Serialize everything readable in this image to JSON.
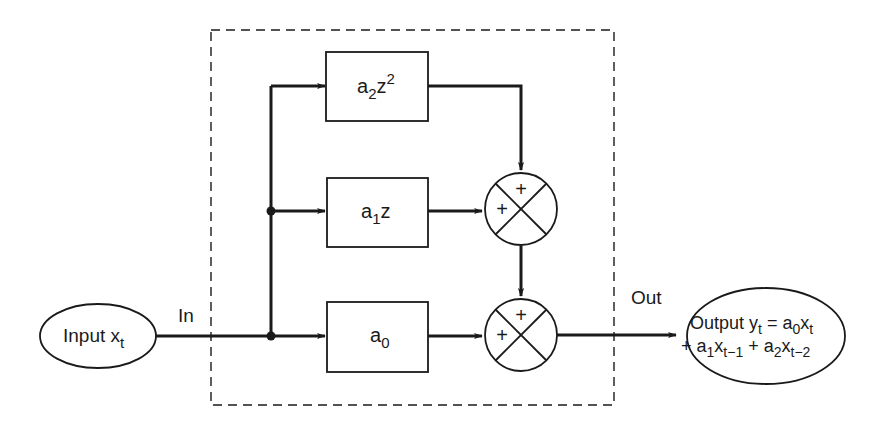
{
  "diagram": {
    "colors": {
      "ink": "#1a1a1a",
      "background": "#ffffff"
    },
    "input_node": {
      "label": "Input x",
      "subscript": "t"
    },
    "output_node": {
      "line1": {
        "prefix": "Output y",
        "y_sub": "t",
        "eq": " = a",
        "a_sub": "0",
        "x": "x",
        "x_sub": "t"
      },
      "line2": {
        "p1": "+ a",
        "s1": "1",
        "x1": "x",
        "xs1": "t−1",
        "p2": " + a",
        "s2": "2",
        "x2": "x",
        "xs2": "t−2"
      }
    },
    "edge_labels": {
      "in": "In",
      "out": "Out"
    },
    "blocks": [
      {
        "id": "a2z2",
        "base": "a",
        "sub": "2",
        "var": "z",
        "sup": "2"
      },
      {
        "id": "a1z",
        "base": "a",
        "sub": "1",
        "var": "z",
        "sup": ""
      },
      {
        "id": "a0",
        "base": "a",
        "sub": "0",
        "var": "",
        "sup": ""
      }
    ],
    "summing_junctions": [
      {
        "id": "sum-top",
        "top_sign": "+",
        "left_sign": "+"
      },
      {
        "id": "sum-bottom",
        "top_sign": "+",
        "left_sign": "+"
      }
    ]
  }
}
